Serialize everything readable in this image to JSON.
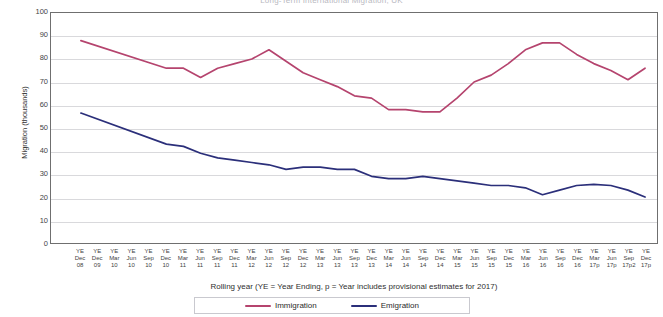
{
  "chart_data": {
    "type": "line",
    "title": "Long-Term International Migration, UK",
    "xlabel": "Rolling year (YE = Year Ending, p = Year includes provisional  estimates for  2017)",
    "ylabel": "Migration (thousands)",
    "ylim": [
      0,
      100
    ],
    "yticks": [
      0,
      10,
      20,
      30,
      40,
      50,
      60,
      70,
      80,
      90,
      100
    ],
    "grid": true,
    "legend_position": "bottom",
    "categories": [
      "YE Dec 08",
      "YE Dec 09",
      "YE Mar 10",
      "YE Jun 10",
      "YE Sep 10",
      "YE Dec 10",
      "YE Mar 11",
      "YE Jun 11",
      "YE Sep 11",
      "YE Dec 11",
      "YE Mar 12",
      "YE Jun 12",
      "YE Sep 12",
      "YE Dec 12",
      "YE Mar 13",
      "YE Jun 13",
      "YE Sep 13",
      "YE Dec 13",
      "YE Mar 14",
      "YE Jun 14",
      "YE Sep 14",
      "YE Dec 14",
      "YE Mar 15",
      "YE Jun 15",
      "YE Sep 15",
      "YE Dec 15",
      "YE Mar 16",
      "YE Jun 16",
      "YE Sep 16",
      "YE Dec 16",
      "YE Mar 17p",
      "YE Jun 17p",
      "YE Sep 17p2",
      "YE Dec 17p"
    ],
    "category_lines": [
      [
        "YE",
        "Dec",
        "08"
      ],
      [
        "YE",
        "Dec",
        "09"
      ],
      [
        "YE",
        "Mar",
        "10"
      ],
      [
        "YE",
        "Jun",
        "10"
      ],
      [
        "YE",
        "Sep",
        "10"
      ],
      [
        "YE",
        "Dec",
        "10"
      ],
      [
        "YE",
        "Mar",
        "11"
      ],
      [
        "YE",
        "Jun",
        "11"
      ],
      [
        "YE",
        "Sep",
        "11"
      ],
      [
        "YE",
        "Dec",
        "11"
      ],
      [
        "YE",
        "Mar",
        "12"
      ],
      [
        "YE",
        "Jun",
        "12"
      ],
      [
        "YE",
        "Sep",
        "12"
      ],
      [
        "YE",
        "Dec",
        "12"
      ],
      [
        "YE",
        "Mar",
        "13"
      ],
      [
        "YE",
        "Jun",
        "13"
      ],
      [
        "YE",
        "Sep",
        "13"
      ],
      [
        "YE",
        "Dec",
        "13"
      ],
      [
        "YE",
        "Mar",
        "14"
      ],
      [
        "YE",
        "Jun",
        "14"
      ],
      [
        "YE",
        "Sep",
        "14"
      ],
      [
        "YE",
        "Dec",
        "14"
      ],
      [
        "YE",
        "Mar",
        "15"
      ],
      [
        "YE",
        "Jun",
        "15"
      ],
      [
        "YE",
        "Sep",
        "15"
      ],
      [
        "YE",
        "Dec",
        "15"
      ],
      [
        "YE",
        "Mar",
        "16"
      ],
      [
        "YE",
        "Jun",
        "16"
      ],
      [
        "YE",
        "Sep",
        "16"
      ],
      [
        "YE",
        "Dec",
        "16"
      ],
      [
        "YE",
        "Mar",
        "17p"
      ],
      [
        "YE",
        "Jun",
        "17p"
      ],
      [
        "YE",
        "Sep",
        "17p2"
      ],
      [
        "YE",
        "Dec",
        "17p"
      ]
    ],
    "series": [
      {
        "name": "Immigration",
        "color": "#b5446e",
        "values": [
          88,
          null,
          null,
          null,
          null,
          null,
          null,
          null,
          null,
          null,
          null,
          null,
          null,
          null,
          null,
          null,
          null,
          null,
          null,
          null,
          null,
          null,
          null,
          null,
          null,
          null,
          null,
          null,
          null,
          null,
          null,
          null,
          null,
          null
        ],
        "points": [
          {
            "x": 0,
            "y": 88
          },
          {
            "x": 5,
            "y": 76
          },
          {
            "x": 6,
            "y": 76
          },
          {
            "x": 7,
            "y": 72
          },
          {
            "x": 8,
            "y": 76
          },
          {
            "x": 9,
            "y": 78
          },
          {
            "x": 10,
            "y": 80
          },
          {
            "x": 11,
            "y": 84
          },
          {
            "x": 12,
            "y": 79
          },
          {
            "x": 13,
            "y": 74
          },
          {
            "x": 14,
            "y": 71
          },
          {
            "x": 15,
            "y": 68
          },
          {
            "x": 16,
            "y": 64
          },
          {
            "x": 17,
            "y": 63
          },
          {
            "x": 18,
            "y": 58
          },
          {
            "x": 19,
            "y": 58
          },
          {
            "x": 20,
            "y": 57
          },
          {
            "x": 21,
            "y": 57
          },
          {
            "x": 22,
            "y": 63
          },
          {
            "x": 23,
            "y": 70
          },
          {
            "x": 24,
            "y": 73
          },
          {
            "x": 25,
            "y": 78
          },
          {
            "x": 26,
            "y": 84
          },
          {
            "x": 27,
            "y": 87
          },
          {
            "x": 28,
            "y": 87
          },
          {
            "x": 29,
            "y": 82
          },
          {
            "x": 30,
            "y": 78
          },
          {
            "x": 31,
            "y": 75
          },
          {
            "x": 32,
            "y": 71
          },
          {
            "x": 33,
            "y": 76
          }
        ]
      },
      {
        "name": "Emigration",
        "color": "#2b2f7a",
        "points": [
          {
            "x": 0,
            "y": 56.5
          },
          {
            "x": 5,
            "y": 43
          },
          {
            "x": 6,
            "y": 42
          },
          {
            "x": 7,
            "y": 39
          },
          {
            "x": 8,
            "y": 37
          },
          {
            "x": 9,
            "y": 36
          },
          {
            "x": 10,
            "y": 35
          },
          {
            "x": 11,
            "y": 34
          },
          {
            "x": 12,
            "y": 32
          },
          {
            "x": 13,
            "y": 33
          },
          {
            "x": 14,
            "y": 33
          },
          {
            "x": 15,
            "y": 32
          },
          {
            "x": 16,
            "y": 32
          },
          {
            "x": 17,
            "y": 29
          },
          {
            "x": 18,
            "y": 28
          },
          {
            "x": 19,
            "y": 28
          },
          {
            "x": 20,
            "y": 29
          },
          {
            "x": 21,
            "y": 28
          },
          {
            "x": 22,
            "y": 27
          },
          {
            "x": 23,
            "y": 26
          },
          {
            "x": 24,
            "y": 25
          },
          {
            "x": 25,
            "y": 25
          },
          {
            "x": 26,
            "y": 24
          },
          {
            "x": 27,
            "y": 21
          },
          {
            "x": 28,
            "y": 23
          },
          {
            "x": 29,
            "y": 25
          },
          {
            "x": 30,
            "y": 25.5
          },
          {
            "x": 31,
            "y": 25
          },
          {
            "x": 32,
            "y": 23
          },
          {
            "x": 33,
            "y": 20
          }
        ]
      }
    ]
  },
  "legend": {
    "items": [
      {
        "label": "Immigration",
        "color": "#b5446e"
      },
      {
        "label": "Emigration",
        "color": "#2b2f7a"
      }
    ]
  }
}
